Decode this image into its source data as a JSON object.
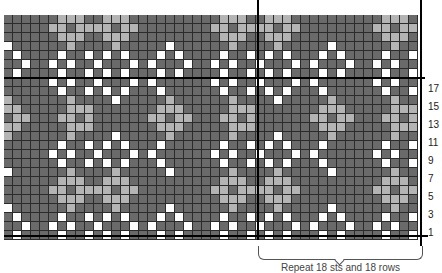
{
  "chart": {
    "columns": 46,
    "rows": 25,
    "cell_size_px": 9,
    "colors": {
      "dark": "#6a6a6a",
      "dark_alt": "#5f5f5f",
      "light": "#b4b4b4",
      "medium": "#8e8e8e",
      "white": "#ffffff",
      "gridline": "#2b2b2b",
      "divider": "#000000"
    },
    "legend_codes": {
      "D": "dark gray",
      "E": "darker gray",
      "L": "light gray",
      "M": "medium gray",
      "W": "white"
    },
    "repeat": {
      "width_sts": 18,
      "height_rows": 18,
      "start_column": 28,
      "caption": "Repeat 18 sts and 18 rows",
      "grid_rows_top_to_bottom": [
        "WDDDWDWDDDDDDWDWDD",
        "DWDWDDDWDDDDDDWDDW",
        "DDWDDDDDLDDDDDDLDD",
        "DDDDDDDLLLDDDDDLLL",
        "DDDDDDLLDLLDDDLLDL",
        "DDDDDDDLLLDDDDDLLL",
        "DDWDDDDDLDDDDDDLDD",
        "DWDWDDDWDDDDDDWDDW",
        "WDDDWDWDDDDDDWDWDD",
        "DWDWDDDWDDDDDDWDDW",
        "DDLDDDDDWDDDDDDLDD",
        "DLLLDDDDDDDDDDLLLD",
        "LLDLLDDDDDDDDLLDLL",
        "DLLLDDDDDDDDDDLLLD",
        "DDLDDDDDWDDDDDDLDD",
        "DWDWDDDWDWDDDDWDDW",
        "WDDDWDWDDDWDDWDWDD",
        "DWDWDDDWDWDDDDWDDW"
      ]
    },
    "row_numbers": [
      "17",
      "15",
      "13",
      "11",
      "9",
      "7",
      "5",
      "3",
      "1"
    ],
    "top_extra_rows": 7
  }
}
